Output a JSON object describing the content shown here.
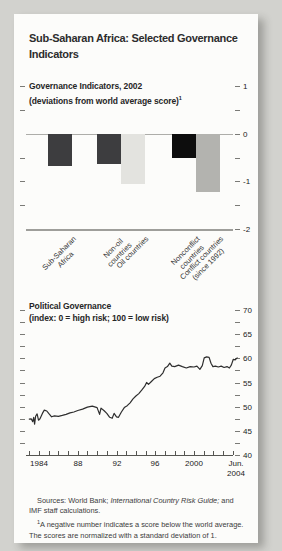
{
  "figure": {
    "title_line1": "Sub-Saharan Africa: Selected Governance",
    "title_line2": "Indicators"
  },
  "chart_data": [
    {
      "type": "bar",
      "title": "Governance Indicators, 2002",
      "subtitle": "(deviations from world average score)",
      "subtitle_sup": "1",
      "categories": [
        [
          "Sub-Saharan",
          "Africa"
        ],
        [
          "Non-oil",
          "countries"
        ],
        [
          "Oil countries"
        ],
        [
          "Nonconflict",
          "countries"
        ],
        [
          "Conflict countries",
          "(since 1992)"
        ]
      ],
      "values": [
        -0.67,
        -0.62,
        -1.05,
        -0.5,
        -1.22
      ],
      "bar_colors": [
        "#3d3d3f",
        "#3d3d3f",
        "#e3e3df",
        "#0d0d0d",
        "#b3b3af"
      ],
      "ylim": [
        -2,
        1
      ],
      "yticks": [
        {
          "v": 1,
          "label": "1"
        },
        {
          "v": 0,
          "label": "0"
        },
        {
          "v": -1,
          "label": "-1"
        },
        {
          "v": -2,
          "label": "-2"
        }
      ],
      "ytick_minor_step": 0.5,
      "grid": "zero-line and bottom border only",
      "legend": "none"
    },
    {
      "type": "line",
      "title": "Political Governance",
      "subtitle": "(index: 0 = high risk; 100 = low risk)",
      "ylim": [
        40,
        70
      ],
      "yticks": [
        40,
        45,
        50,
        55,
        60,
        65,
        70
      ],
      "ytick_minor_step": 2.5,
      "xlim": [
        1983,
        2004.5
      ],
      "xtick_every_year": true,
      "xtick_labels": [
        {
          "year": 1984,
          "label": "1984"
        },
        {
          "year": 1988,
          "label": "88"
        },
        {
          "year": 1992,
          "label": "92"
        },
        {
          "year": 1996,
          "label": "96"
        },
        {
          "year": 2000,
          "label": "2000"
        }
      ],
      "x_end_label": [
        "Jun.",
        "2004"
      ],
      "line_color": "#2e2e2e",
      "x": [
        1983.0,
        1983.2,
        1983.35,
        1983.45,
        1983.55,
        1983.65,
        1983.8,
        1983.95,
        1984.1,
        1984.35,
        1984.55,
        1984.8,
        1985.0,
        1985.3,
        1985.6,
        1986.0,
        1986.4,
        1986.8,
        1987.2,
        1987.6,
        1988.0,
        1988.5,
        1989.0,
        1989.5,
        1990.0,
        1990.25,
        1990.4,
        1990.7,
        1991.0,
        1991.3,
        1991.55,
        1991.75,
        1992.0,
        1992.2,
        1992.5,
        1992.8,
        1993.1,
        1993.4,
        1993.7,
        1994.0,
        1994.3,
        1994.6,
        1994.9,
        1995.1,
        1995.3,
        1995.6,
        1995.9,
        1996.2,
        1996.5,
        1996.8,
        1997.0,
        1997.25,
        1997.5,
        1997.7,
        1998.0,
        1998.4,
        1998.8,
        1999.2,
        1999.6,
        2000.0,
        2000.3,
        2000.6,
        2000.85,
        2001.05,
        2001.3,
        2001.55,
        2001.75,
        2001.95,
        2002.2,
        2002.5,
        2002.8,
        2003.1,
        2003.4,
        2003.65,
        2003.85,
        2004.05,
        2004.25,
        2004.45
      ],
      "y": [
        47.4,
        47.5,
        46.9,
        47.8,
        46.4,
        48.0,
        48.5,
        47.2,
        47.5,
        48.6,
        49.3,
        49.1,
        48.6,
        47.9,
        48.1,
        48.0,
        48.2,
        48.4,
        48.7,
        48.9,
        49.2,
        49.5,
        49.9,
        50.1,
        49.8,
        48.4,
        49.7,
        49.2,
        48.6,
        47.8,
        47.6,
        48.6,
        47.9,
        47.8,
        48.9,
        49.8,
        50.2,
        50.8,
        51.6,
        52.2,
        52.7,
        53.4,
        54.2,
        55.0,
        54.6,
        55.2,
        55.8,
        56.1,
        56.3,
        57.0,
        58.0,
        58.3,
        59.0,
        58.4,
        58.3,
        58.6,
        58.3,
        58.0,
        58.3,
        58.2,
        58.4,
        57.7,
        58.5,
        60.1,
        60.3,
        60.2,
        59.0,
        58.3,
        58.4,
        58.2,
        58.4,
        58.1,
        58.3,
        58.0,
        58.6,
        59.8,
        59.7,
        60.1
      ]
    }
  ],
  "footer": {
    "sources_prefix": "Sources: World Bank; ",
    "sources_italic": "International Country Risk Guide;",
    "sources_suffix": " and IMF staff calculations.",
    "footnote_sup": "1",
    "footnote_text": "A negative number indicates a score below the world average. The scores are normalized with a standard deviation of 1."
  }
}
